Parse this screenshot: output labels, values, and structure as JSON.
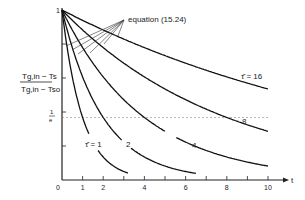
{
  "chart_data": {
    "type": "line",
    "title": "",
    "xlabel": "t",
    "ylabel_numerator": "Tg,in − Ts",
    "ylabel_denominator": "Tg,in − Tso",
    "xlim": [
      0,
      10.5
    ],
    "ylim": [
      0,
      1
    ],
    "x_ticks": [
      0,
      1,
      2,
      3,
      4,
      5,
      6,
      7,
      8,
      9,
      10
    ],
    "x_tick_labels": [
      {
        "value": 0,
        "label": "0"
      },
      {
        "value": 1,
        "label": "1"
      },
      {
        "value": 2,
        "label": "2"
      },
      {
        "value": 4,
        "label": "4"
      },
      {
        "value": 6,
        "label": "6"
      },
      {
        "value": 8,
        "label": "8"
      },
      {
        "value": 10,
        "label": "10"
      }
    ],
    "y_tick_labels": [
      {
        "value": 1,
        "label": "1"
      },
      {
        "value": 0.368,
        "label_num": "1",
        "label_den": "e"
      }
    ],
    "y_ticks": [
      0.2,
      0.4,
      0.6,
      0.8,
      1.0
    ],
    "reference_line": {
      "value": 0.368,
      "label": "1/e",
      "style": "dashed"
    },
    "annotation": {
      "text": "equation (15.24)",
      "points_to": "initial tangent lines of each curve"
    },
    "series": [
      {
        "name": "τ = 1",
        "label": "τ̂ = 1",
        "tau": 1,
        "t_end": 3.2,
        "label_pos": [
          1.6,
          0.27
        ]
      },
      {
        "name": "τ = 2",
        "label": "2",
        "tau": 2,
        "t_end": 6.5,
        "label_pos": [
          3.0,
          0.27
        ]
      },
      {
        "name": "τ = 4",
        "label": "4",
        "tau": 4,
        "t_end": 10,
        "label_pos": [
          5.3,
          0.24
        ]
      },
      {
        "name": "τ = 8",
        "label": "8",
        "tau": 8,
        "t_end": 10,
        "label_pos": [
          10.3,
          0.39
        ]
      },
      {
        "name": "τ = 16",
        "label": "τ̂ = 16",
        "tau": 16,
        "t_end": 10,
        "label_pos": [
          10.3,
          0.57
        ]
      }
    ],
    "grid": false,
    "legend": "inline labels"
  },
  "labels": {
    "origin": "0",
    "x_axis": "t",
    "y_top": "1",
    "e_num": "1",
    "e_den": "e",
    "annotation": "equation (15.24)",
    "curve_1": "τ̂ = 1",
    "curve_2": "2",
    "curve_4": "4",
    "curve_8": "8",
    "curve_16": "τ̂ = 16",
    "ylabel_num": "Tg,in − Ts",
    "ylabel_den": "Tg,in − Tso",
    "x1": "1",
    "x2": "2",
    "x4": "4",
    "x6": "6",
    "x8": "8",
    "x10": "10"
  }
}
